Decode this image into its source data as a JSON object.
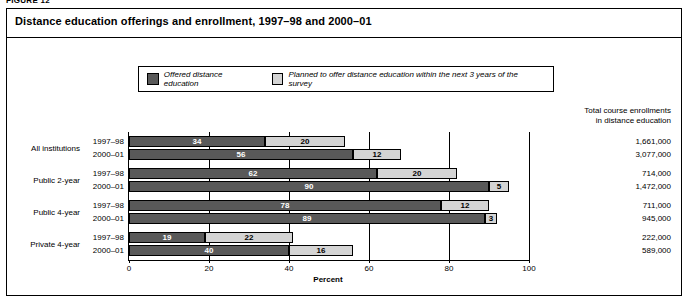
{
  "figure_label": "FIGURE 12",
  "title": "Distance education offerings and enrollment, 1997–98 and 2000–01",
  "legend": [
    {
      "key": "offered",
      "label": "Offered distance education",
      "color": "#595959"
    },
    {
      "key": "planned",
      "label": "Planned to offer distance education within the next 3 years of the survey",
      "color": "#d4d4d4"
    }
  ],
  "totals_header_line1": "Total course enrollments",
  "totals_header_line2": "in distance education",
  "chart_data": {
    "type": "bar",
    "orientation": "horizontal",
    "stacked": true,
    "title": "Distance education offerings and enrollment, 1997–98 and 2000–01",
    "xlabel": "Percent",
    "ylabel": "",
    "xlim": [
      0,
      100
    ],
    "xticks": [
      0,
      20,
      40,
      60,
      80,
      100
    ],
    "grid": true,
    "legend_position": "top",
    "series": [
      {
        "name": "Offered distance education",
        "color": "#595959"
      },
      {
        "name": "Planned to offer distance education within the next 3 years of the survey",
        "color": "#d4d4d4"
      }
    ],
    "groups": [
      {
        "label": "All institutions",
        "rows": [
          {
            "year": "1997–98",
            "offered": 34,
            "planned": 20,
            "total_enrollment": "1,661,000"
          },
          {
            "year": "2000–01",
            "offered": 56,
            "planned": 12,
            "total_enrollment": "3,077,000"
          }
        ]
      },
      {
        "label": "Public 2-year",
        "rows": [
          {
            "year": "1997–98",
            "offered": 62,
            "planned": 20,
            "total_enrollment": "714,000"
          },
          {
            "year": "2000–01",
            "offered": 90,
            "planned": 5,
            "total_enrollment": "1,472,000"
          }
        ]
      },
      {
        "label": "Public 4-year",
        "rows": [
          {
            "year": "1997–98",
            "offered": 78,
            "planned": 12,
            "total_enrollment": "711,000"
          },
          {
            "year": "2000–01",
            "offered": 89,
            "planned": 3,
            "total_enrollment": "945,000"
          }
        ]
      },
      {
        "label": "Private 4-year",
        "rows": [
          {
            "year": "1997–98",
            "offered": 19,
            "planned": 22,
            "total_enrollment": "222,000"
          },
          {
            "year": "2000–01",
            "offered": 40,
            "planned": 16,
            "total_enrollment": "589,000"
          }
        ]
      }
    ]
  }
}
